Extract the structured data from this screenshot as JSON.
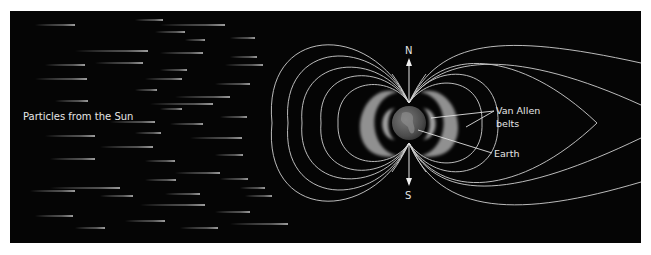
{
  "diagram": {
    "panel": {
      "x": 10,
      "y": 11,
      "width": 631,
      "height": 232,
      "background": "#050505"
    },
    "labels": {
      "particles": "Particles from the Sun",
      "north": "N",
      "south": "S",
      "van_allen_line1": "Van Allen",
      "van_allen_line2": "belts",
      "earth": "Earth"
    },
    "earth": {
      "cx": 409,
      "cy": 123,
      "r": 17
    },
    "poles": {
      "north": [
        409,
        103
      ],
      "south": [
        409,
        143
      ]
    },
    "colors": {
      "field_lines": "#cfcfcf",
      "text": "#e6e6e6",
      "belt": "#9a9a9a",
      "earth": "#5a5a5a"
    },
    "particle_streaks": [
      [
        35,
        75,
        25
      ],
      [
        135,
        163,
        20
      ],
      [
        160,
        225,
        25
      ],
      [
        155,
        185,
        32
      ],
      [
        185,
        205,
        40
      ],
      [
        230,
        255,
        38
      ],
      [
        75,
        148,
        51
      ],
      [
        160,
        203,
        53
      ],
      [
        230,
        257,
        57
      ],
      [
        45,
        85,
        65
      ],
      [
        95,
        143,
        63
      ],
      [
        160,
        187,
        70
      ],
      [
        225,
        263,
        65
      ],
      [
        35,
        87,
        79
      ],
      [
        145,
        182,
        79
      ],
      [
        215,
        250,
        84
      ],
      [
        135,
        157,
        90
      ],
      [
        55,
        88,
        101
      ],
      [
        175,
        230,
        97
      ],
      [
        150,
        213,
        104
      ],
      [
        160,
        182,
        109
      ],
      [
        220,
        247,
        117
      ],
      [
        110,
        155,
        122
      ],
      [
        170,
        203,
        124
      ],
      [
        135,
        161,
        133
      ],
      [
        45,
        95,
        136
      ],
      [
        100,
        153,
        147
      ],
      [
        190,
        242,
        138
      ],
      [
        215,
        243,
        155
      ],
      [
        50,
        95,
        159
      ],
      [
        145,
        175,
        161
      ],
      [
        175,
        220,
        173
      ],
      [
        145,
        176,
        180
      ],
      [
        220,
        248,
        179
      ],
      [
        30,
        75,
        191
      ],
      [
        50,
        120,
        188
      ],
      [
        240,
        265,
        188
      ],
      [
        100,
        133,
        196
      ],
      [
        165,
        200,
        194
      ],
      [
        245,
        272,
        196
      ],
      [
        140,
        205,
        205
      ],
      [
        215,
        250,
        212
      ],
      [
        35,
        73,
        216
      ],
      [
        125,
        165,
        221
      ],
      [
        75,
        105,
        228
      ],
      [
        180,
        218,
        228
      ],
      [
        230,
        288,
        224
      ]
    ]
  }
}
